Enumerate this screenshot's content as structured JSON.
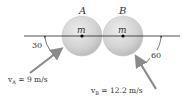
{
  "diagram": {
    "type": "collision-of-two-spheres",
    "balls": [
      {
        "id": "A",
        "label": "A",
        "mass_label": "m",
        "cx": 82,
        "cy": 36,
        "r": 20
      },
      {
        "id": "B",
        "label": "B",
        "mass_label": "m",
        "cx": 123,
        "cy": 36,
        "r": 20
      }
    ],
    "line_of_impact": {
      "x1": 24,
      "x2": 180,
      "y": 36
    },
    "velocities": [
      {
        "id": "vA",
        "label": "v",
        "subscript": "A",
        "value_text": " = 9 m/s",
        "angle_label": "30"
      },
      {
        "id": "vB",
        "label": "v",
        "subscript": "B",
        "value_text": " = 12.2 m/s",
        "angle_label": "60"
      }
    ],
    "colors": {
      "ball_fill": "#d3d3d3",
      "ball_edge": "#b8b8b8",
      "arrow": "#8a8a8a",
      "line": "#222222",
      "text": "#333333"
    }
  }
}
